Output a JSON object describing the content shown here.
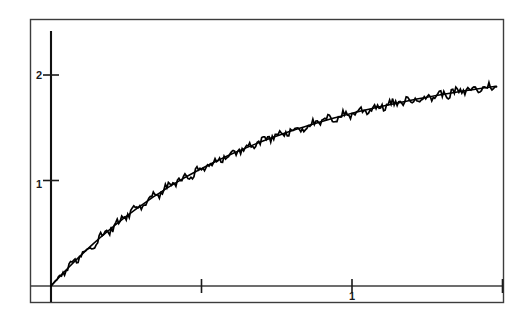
{
  "figure": {
    "background_color": "#ffffff",
    "line_color": "#000000",
    "frame_color": "#3c3c3c",
    "axis_color": "#000000"
  },
  "axes": {
    "x_tick_labels": [
      "",
      "1",
      ""
    ],
    "y_tick_labels": [
      "1",
      "2"
    ],
    "x_ticks_values": [
      0.5,
      1.0,
      1.5
    ],
    "y_ticks_values": [
      1,
      2
    ]
  },
  "chart_data": {
    "type": "line",
    "title": "",
    "xlabel": "",
    "ylabel": "",
    "xlim": [
      -0.17,
      1.59
    ],
    "ylim": [
      -0.16,
      2.51
    ],
    "grid": false,
    "legend": null,
    "x_tick_values": [
      0.5,
      1.0,
      1.5
    ],
    "x_tick_labels": [
      "",
      "1",
      ""
    ],
    "y_tick_values": [
      1,
      2
    ],
    "y_tick_labels": [
      "1",
      "2"
    ],
    "axis_origin": [
      0,
      0
    ],
    "series": [
      {
        "name": "smooth-curve",
        "style": "solid",
        "x": [
          0.0,
          0.02,
          0.04,
          0.06,
          0.08,
          0.1,
          0.12,
          0.14,
          0.16,
          0.18,
          0.2,
          0.22,
          0.24,
          0.26,
          0.28,
          0.3,
          0.32,
          0.34,
          0.36,
          0.38,
          0.4,
          0.42,
          0.44,
          0.46,
          0.48,
          0.5,
          0.52,
          0.54,
          0.56,
          0.58,
          0.6,
          0.62,
          0.64,
          0.66,
          0.68,
          0.7,
          0.72,
          0.74,
          0.76,
          0.78,
          0.8,
          0.82,
          0.84,
          0.86,
          0.88,
          0.9,
          0.92,
          0.94,
          0.96,
          0.98,
          1.0,
          1.02,
          1.04,
          1.06,
          1.08,
          1.1,
          1.12,
          1.14,
          1.16,
          1.18,
          1.2,
          1.22,
          1.24,
          1.26,
          1.28,
          1.3,
          1.32,
          1.34,
          1.36,
          1.38,
          1.4,
          1.42,
          1.44,
          1.46,
          1.48
        ],
        "y": [
          0.0,
          0.062,
          0.122,
          0.181,
          0.238,
          0.293,
          0.347,
          0.399,
          0.45,
          0.499,
          0.547,
          0.593,
          0.638,
          0.682,
          0.724,
          0.765,
          0.805,
          0.844,
          0.881,
          0.918,
          0.953,
          0.987,
          1.02,
          1.052,
          1.083,
          1.113,
          1.142,
          1.171,
          1.198,
          1.225,
          1.251,
          1.276,
          1.3,
          1.324,
          1.347,
          1.369,
          1.391,
          1.412,
          1.432,
          1.452,
          1.471,
          1.49,
          1.508,
          1.526,
          1.543,
          1.56,
          1.576,
          1.592,
          1.607,
          1.622,
          1.637,
          1.651,
          1.665,
          1.678,
          1.691,
          1.704,
          1.716,
          1.728,
          1.74,
          1.752,
          1.763,
          1.774,
          1.785,
          1.795,
          1.805,
          1.815,
          1.825,
          1.834,
          1.843,
          1.852,
          1.861,
          1.87,
          1.878,
          1.886,
          1.894
        ]
      },
      {
        "name": "noisy-curve",
        "style": "solid",
        "noise_amplitude": 0.055,
        "x": [
          0.0,
          0.005,
          0.01,
          0.015,
          0.02,
          0.025,
          0.03,
          0.035,
          0.04,
          0.045,
          0.05,
          0.055,
          0.06,
          0.065,
          0.07,
          0.075,
          0.08,
          0.085,
          0.09,
          0.095,
          0.1,
          0.105,
          0.11,
          0.115,
          0.12,
          0.125,
          0.13,
          0.135,
          0.14,
          0.145,
          0.15,
          0.155,
          0.16,
          0.165,
          0.17,
          0.175,
          0.18,
          0.185,
          0.19,
          0.195,
          0.2,
          0.205,
          0.21,
          0.215,
          0.22,
          0.225,
          0.23,
          0.235,
          0.24,
          0.245,
          0.25,
          0.255,
          0.26,
          0.265,
          0.27,
          0.275,
          0.28,
          0.285,
          0.29,
          0.295,
          0.3,
          0.305,
          0.31,
          0.315,
          0.32,
          0.325,
          0.33,
          0.335,
          0.34,
          0.345,
          0.35,
          0.355,
          0.36,
          0.365,
          0.37,
          0.375,
          0.38,
          0.385,
          0.39,
          0.395,
          0.4,
          0.405,
          0.41,
          0.415,
          0.42,
          0.425,
          0.43,
          0.435,
          0.44,
          0.445,
          0.45,
          0.455,
          0.46,
          0.465,
          0.47,
          0.475,
          0.48,
          0.485,
          0.49,
          0.495,
          0.5,
          0.505,
          0.51,
          0.515,
          0.52,
          0.525,
          0.53,
          0.535,
          0.54,
          0.545,
          0.55,
          0.555,
          0.56,
          0.565,
          0.57,
          0.575,
          0.58,
          0.585,
          0.59,
          0.595,
          0.6,
          0.605,
          0.61,
          0.615,
          0.62,
          0.625,
          0.63,
          0.635,
          0.64,
          0.645,
          0.65,
          0.655,
          0.66,
          0.665,
          0.67,
          0.675,
          0.68,
          0.685,
          0.69,
          0.695,
          0.7,
          0.705,
          0.71,
          0.715,
          0.72,
          0.725,
          0.73,
          0.735,
          0.74,
          0.745,
          0.75,
          0.755,
          0.76,
          0.765,
          0.77,
          0.775,
          0.78,
          0.785,
          0.79,
          0.795,
          0.8,
          0.805,
          0.81,
          0.815,
          0.82,
          0.825,
          0.83,
          0.835,
          0.84,
          0.845,
          0.85,
          0.855,
          0.86,
          0.865,
          0.87,
          0.875,
          0.88,
          0.885,
          0.89,
          0.895,
          0.9,
          0.905,
          0.91,
          0.915,
          0.92,
          0.925,
          0.93,
          0.935,
          0.94,
          0.945,
          0.95,
          0.955,
          0.96,
          0.965,
          0.97,
          0.975,
          0.98,
          0.985,
          0.99,
          0.995,
          1.0,
          1.005,
          1.01,
          1.015,
          1.02,
          1.025,
          1.03,
          1.035,
          1.04,
          1.045,
          1.05,
          1.055,
          1.06,
          1.065,
          1.07,
          1.075,
          1.08,
          1.085,
          1.09,
          1.095,
          1.1,
          1.105,
          1.11,
          1.115,
          1.12,
          1.125,
          1.13,
          1.135,
          1.14,
          1.145,
          1.15,
          1.155,
          1.16,
          1.165,
          1.17,
          1.175,
          1.18,
          1.185,
          1.19,
          1.195,
          1.2,
          1.205,
          1.21,
          1.215,
          1.22,
          1.225,
          1.23,
          1.235,
          1.24,
          1.245,
          1.25,
          1.255,
          1.26,
          1.265,
          1.27,
          1.275,
          1.28,
          1.285,
          1.29,
          1.295,
          1.3,
          1.305,
          1.31,
          1.315,
          1.32,
          1.325,
          1.33,
          1.335,
          1.34,
          1.345,
          1.35,
          1.355,
          1.36,
          1.365,
          1.37,
          1.375,
          1.38,
          1.385,
          1.39,
          1.395,
          1.4,
          1.405,
          1.41,
          1.415,
          1.42,
          1.425,
          1.43,
          1.435,
          1.44,
          1.445,
          1.45,
          1.455,
          1.46,
          1.465,
          1.47,
          1.475,
          1.48
        ]
      }
    ]
  }
}
